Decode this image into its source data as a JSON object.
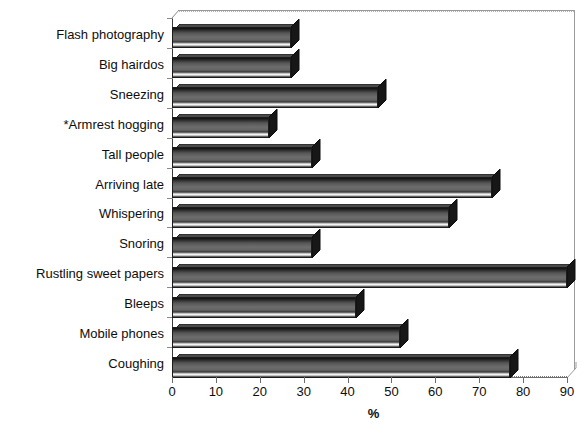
{
  "chart_data": {
    "type": "bar",
    "orientation": "horizontal",
    "title": "",
    "subtitle": "",
    "xlabel": "%",
    "ylabel": "",
    "xlim": [
      0,
      90
    ],
    "xticks": [
      0,
      10,
      20,
      30,
      40,
      50,
      60,
      70,
      80,
      90
    ],
    "xtick_labels": [
      "0",
      "10",
      "20",
      "30",
      "40",
      "50",
      "60",
      "70",
      "80",
      "90"
    ],
    "grid": false,
    "legend": null,
    "style": "3d-bar",
    "categories": [
      "Flash photography",
      "Big hairdos",
      "Sneezing",
      "*Armrest hogging",
      "Tall people",
      "Arriving late",
      "Whispering",
      "Snoring",
      "Rustling sweet papers",
      "Bleeps",
      "Mobile phones",
      "Coughing"
    ],
    "values": [
      27,
      27,
      47,
      22,
      32,
      73,
      63,
      32,
      90,
      42,
      52,
      77
    ],
    "annotations": [
      "*Armrest hogging"
    ],
    "colors": {
      "bar_face_dark": "#1b1b1b",
      "bar_face_mid": "#6d6d6d",
      "bar_highlight": "#f2f2f2",
      "bar_top": "#3c3c3c",
      "bar_side": "#101010",
      "axis": "#6d6d6d",
      "frame": "#9a9a9a",
      "text": "#0d0d0d",
      "background": "#ffffff"
    }
  }
}
